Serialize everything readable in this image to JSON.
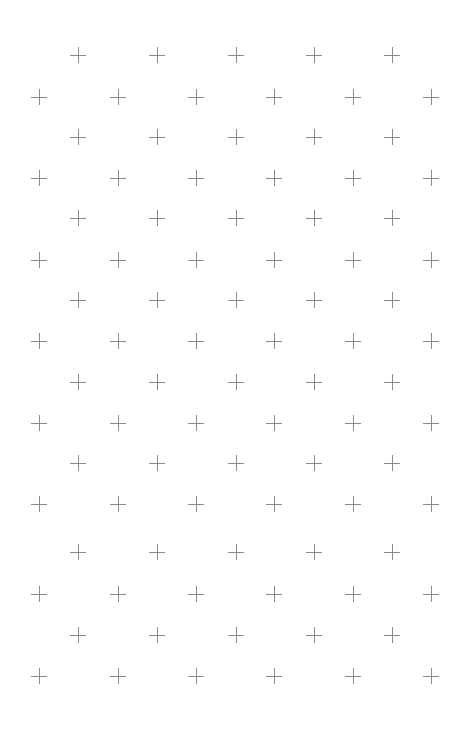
{
  "pattern": {
    "name": "plus-grid-pattern",
    "color": "#8a8a8a",
    "background": "#ffffff",
    "symbol": "plus-icon",
    "rows": [
      {
        "y": 55,
        "xs": [
          78,
          157,
          236,
          314,
          392
        ]
      },
      {
        "y": 97,
        "xs": [
          39,
          118,
          196,
          274,
          353,
          431
        ]
      },
      {
        "y": 137,
        "xs": [
          78,
          157,
          236,
          314,
          392
        ]
      },
      {
        "y": 178,
        "xs": [
          39,
          118,
          196,
          274,
          353,
          431
        ]
      },
      {
        "y": 218,
        "xs": [
          78,
          157,
          236,
          314,
          392
        ]
      },
      {
        "y": 260,
        "xs": [
          39,
          118,
          196,
          274,
          353,
          431
        ]
      },
      {
        "y": 300,
        "xs": [
          78,
          157,
          236,
          314,
          392
        ]
      },
      {
        "y": 341,
        "xs": [
          39,
          118,
          196,
          274,
          353,
          431
        ]
      },
      {
        "y": 382,
        "xs": [
          78,
          157,
          236,
          314,
          392
        ]
      },
      {
        "y": 423,
        "xs": [
          39,
          118,
          196,
          274,
          353,
          431
        ]
      },
      {
        "y": 463,
        "xs": [
          78,
          157,
          236,
          314,
          392
        ]
      },
      {
        "y": 504,
        "xs": [
          39,
          118,
          196,
          274,
          353,
          431
        ]
      },
      {
        "y": 552,
        "xs": [
          78,
          157,
          236,
          314,
          392
        ]
      },
      {
        "y": 594,
        "xs": [
          39,
          118,
          196,
          274,
          353,
          431
        ]
      },
      {
        "y": 635,
        "xs": [
          78,
          157,
          236,
          314,
          392
        ]
      },
      {
        "y": 676,
        "xs": [
          39,
          118,
          196,
          274,
          353,
          431
        ]
      }
    ]
  }
}
